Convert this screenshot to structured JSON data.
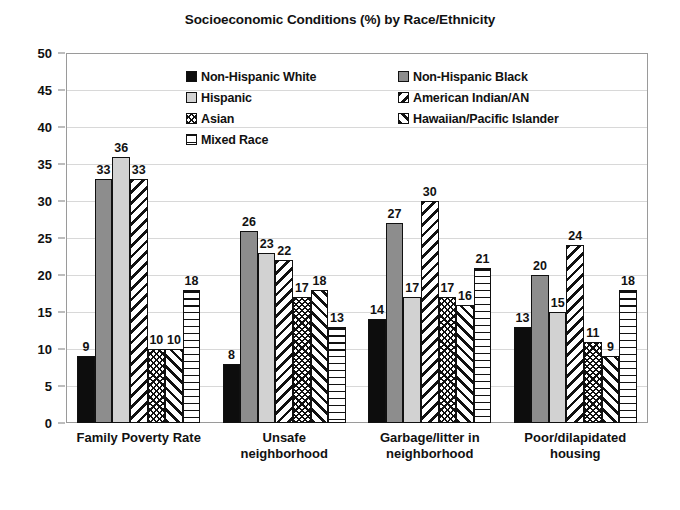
{
  "chart_data": {
    "type": "bar",
    "title": "Socioeconomic Conditions (%) by Race/Ethnicity",
    "xlabel": "",
    "ylabel": "",
    "ylim": [
      0,
      50
    ],
    "ytick_step": 5,
    "grid": true,
    "legend_position": "inside-top-center",
    "categories": [
      "Family Poverty Rate",
      "Unsafe\nneighborhood",
      "Garbage/litter in\nneighborhood",
      "Poor/dilapidated\nhousing"
    ],
    "yticks": [
      "50",
      "45",
      "40",
      "35",
      "30",
      "25",
      "20",
      "15",
      "10",
      "5",
      "0"
    ],
    "series": [
      {
        "name": "Non-Hispanic White",
        "pattern": "solid-black",
        "values": [
          9,
          8,
          14,
          13
        ]
      },
      {
        "name": "Non-Hispanic Black",
        "pattern": "gray",
        "values": [
          33,
          26,
          27,
          20
        ]
      },
      {
        "name": "Hispanic",
        "pattern": "light-gray",
        "values": [
          36,
          23,
          17,
          15
        ]
      },
      {
        "name": "American Indian/AN",
        "pattern": "diag-back",
        "values": [
          33,
          22,
          30,
          24
        ]
      },
      {
        "name": "Asian",
        "pattern": "dots",
        "values": [
          10,
          17,
          17,
          11
        ]
      },
      {
        "name": "Hawaiian/Pacific Islander",
        "pattern": "diag-fwd",
        "values": [
          10,
          18,
          16,
          9
        ]
      },
      {
        "name": "Mixed Race",
        "pattern": "horizontal",
        "values": [
          18,
          13,
          21,
          18
        ]
      }
    ]
  },
  "legend": {
    "left_column": [
      {
        "label": "Non-Hispanic White",
        "pattern": "solid-black"
      },
      {
        "label": "Hispanic",
        "pattern": "light-gray"
      },
      {
        "label": "Asian",
        "pattern": "dots"
      },
      {
        "label": "Mixed Race",
        "pattern": "horizontal"
      }
    ],
    "right_column": [
      {
        "label": "Non-Hispanic Black",
        "pattern": "gray"
      },
      {
        "label": "American Indian/AN",
        "pattern": "diag-back"
      },
      {
        "label": "Hawaiian/Pacific Islander",
        "pattern": "diag-fwd"
      }
    ]
  },
  "colors": {
    "solid_black": "#0d0d0d",
    "gray": "#8d8d8d",
    "light_gray": "#d2d2d2",
    "outline": "#111111",
    "gridline": "#d8d8d8",
    "frame": "#9a9a9a",
    "background": "#ffffff"
  }
}
